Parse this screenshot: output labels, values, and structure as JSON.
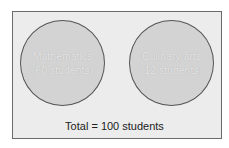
{
  "diagram": {
    "type": "venn-disjoint-sets",
    "sets": [
      {
        "name": "Mathematics",
        "count_label": "(60 students)",
        "count": 60
      },
      {
        "name": "Culinary arts",
        "count_label": "(12 students)",
        "count": 12
      }
    ],
    "total_label": "Total = 100 students",
    "total": 100
  },
  "colors": {
    "frame_fill": "#ececec",
    "frame_border": "#6a6a6a",
    "circle_fill": "#d3d3d3",
    "circle_border": "#555555",
    "circle_text": "#e6e6e6",
    "total_text": "#222222"
  }
}
